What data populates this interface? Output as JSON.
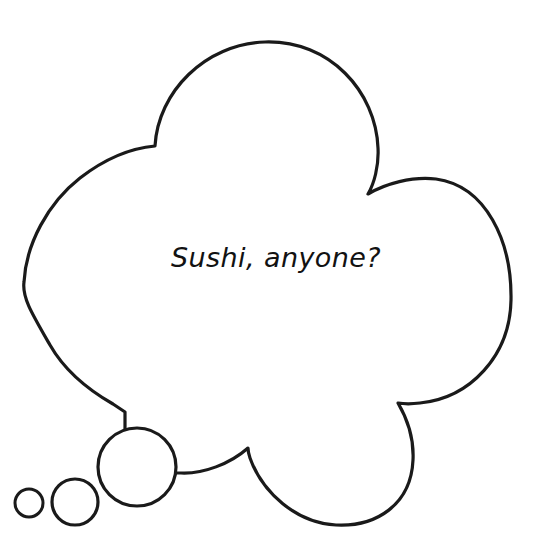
{
  "canvas": {
    "width": 552,
    "height": 557,
    "background_color": "#ffffff"
  },
  "bubble": {
    "kind": "thought-bubble",
    "shape": "cloud",
    "outline_color": "#1a1a1a",
    "fill_color": "#ffffff",
    "stroke_width": 3.2,
    "lobe_count": 4,
    "text": "Sushi, anyone?",
    "text_color": "#121212",
    "text_font_size_px": 27,
    "text_center": {
      "x": 265,
      "y": 258
    }
  },
  "trail_bubbles": [
    {
      "label": "large-trail-bubble",
      "cx": 137,
      "cy": 467,
      "r": 39
    },
    {
      "label": "medium-trail-bubble",
      "cx": 75,
      "cy": 502,
      "r": 23
    },
    {
      "label": "small-trail-bubble",
      "cx": 29,
      "cy": 503,
      "r": 14
    }
  ],
  "cusps": [
    {
      "label": "top-left-cusp",
      "x": 155,
      "y": 146
    },
    {
      "label": "top-right-cusp",
      "x": 368,
      "y": 194
    },
    {
      "label": "right-bottom-cusp",
      "x": 398,
      "y": 403
    },
    {
      "label": "bottom-left-cusp",
      "x": 248,
      "y": 448
    },
    {
      "label": "tail-upper-join",
      "x": 125,
      "y": 412
    },
    {
      "label": "tail-lower-join",
      "x": 175,
      "y": 473
    }
  ],
  "extremes": {
    "top_peak": {
      "x": 265,
      "y": 42
    },
    "left_edge": {
      "x": 24,
      "y": 282
    },
    "right_edge": {
      "x": 511,
      "y": 300
    },
    "bottom_edge": {
      "x": 320,
      "y": 524
    }
  }
}
